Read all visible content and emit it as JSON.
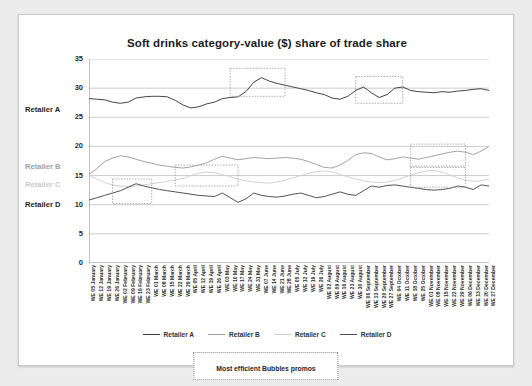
{
  "chart_data": {
    "type": "line",
    "title": "Soft drinks category-value ($) share of trade share",
    "xlabel": "",
    "ylabel": "",
    "ylim": [
      0,
      35
    ],
    "yticks": [
      0,
      5,
      10,
      15,
      20,
      25,
      30,
      35
    ],
    "grid": true,
    "legend_position": "bottom",
    "annotation": "Most efficient Bubbles promos",
    "categories": [
      "WE 05 January",
      "WE 12 January",
      "WE 19 January",
      "WE 26 January",
      "WE 02 February",
      "WE 09 February",
      "WE 16 February",
      "WE 23 February",
      "WE 01 March",
      "WE 08 March",
      "WE 15 March",
      "WE 22 March",
      "WE 29 March",
      "WE 05 April",
      "WE 12 April",
      "WE 19 April",
      "WE 26 April",
      "WE 03 May",
      "WE 10 May",
      "WE 17 May",
      "WE 24 May",
      "WE 31 May",
      "WE 07 June",
      "WE 14 June",
      "WE 21 June",
      "WE 28 June",
      "WE 05 July",
      "WE 12 July",
      "WE 19 July",
      "WE 26 July",
      "WE 02 August",
      "WE 09 August",
      "WE 16 August",
      "WE 23 August",
      "WE 30 August",
      "WE 06 September",
      "WE 13 September",
      "WE 20 September",
      "WE 27 September",
      "WE 04 October",
      "WE 11 October",
      "WE 18 October",
      "WE 25 October",
      "WE 01 November",
      "WE 08 November",
      "WE 15 November",
      "WE 22 November",
      "WE 29 November",
      "WE 06 December",
      "WE 13 December",
      "WE 20 December",
      "WE 27 December"
    ],
    "series": [
      {
        "name": "Retailer A",
        "color": "#3a3a3a",
        "values": [
          28.2,
          28.1,
          28.0,
          27.6,
          27.4,
          27.6,
          28.3,
          28.5,
          28.6,
          28.6,
          28.5,
          27.9,
          27.1,
          26.6,
          26.8,
          27.3,
          27.6,
          28.2,
          28.4,
          28.5,
          29.4,
          31.0,
          31.8,
          31.2,
          30.8,
          30.5,
          30.2,
          29.9,
          29.6,
          29.2,
          28.9,
          28.3,
          28.1,
          28.6,
          29.6,
          30.2,
          29.2,
          28.4,
          28.9,
          30.0,
          30.2,
          29.6,
          29.4,
          29.3,
          29.2,
          29.4,
          29.3,
          29.5,
          29.6,
          29.8,
          29.9,
          29.6
        ]
      },
      {
        "name": "Retailer B",
        "color": "#9d9d9d",
        "values": [
          15.2,
          16.2,
          17.4,
          18.0,
          18.4,
          18.2,
          17.8,
          17.4,
          17.1,
          16.8,
          16.6,
          16.4,
          16.3,
          16.5,
          16.8,
          17.2,
          17.8,
          18.3,
          18.0,
          17.7,
          17.9,
          18.1,
          18.0,
          17.9,
          18.0,
          18.1,
          18.0,
          17.8,
          17.4,
          16.9,
          16.4,
          16.3,
          16.8,
          17.6,
          18.6,
          18.9,
          18.8,
          18.2,
          17.7,
          17.9,
          18.2,
          18.0,
          17.8,
          18.1,
          18.4,
          18.7,
          19.0,
          19.2,
          19.0,
          18.6,
          19.2,
          20.0
        ]
      },
      {
        "name": "Retailer C",
        "color": "#cfcfcf",
        "values": [
          15.1,
          14.4,
          13.8,
          13.4,
          13.2,
          13.1,
          13.2,
          13.4,
          13.6,
          13.8,
          14.0,
          14.3,
          14.5,
          15.0,
          15.4,
          15.6,
          15.5,
          15.2,
          14.8,
          14.4,
          14.1,
          13.9,
          13.8,
          13.7,
          13.9,
          14.2,
          14.6,
          15.0,
          15.4,
          15.7,
          15.8,
          15.6,
          15.2,
          14.8,
          14.4,
          14.1,
          13.9,
          13.8,
          13.9,
          14.2,
          14.6,
          15.1,
          15.5,
          15.8,
          15.9,
          15.6,
          15.1,
          14.6,
          14.2,
          14.0,
          14.1,
          14.4
        ]
      },
      {
        "name": "Retailer D",
        "color": "#4a4a4a",
        "values": [
          10.8,
          11.2,
          11.6,
          12.0,
          12.4,
          13.0,
          13.6,
          13.2,
          12.9,
          12.6,
          12.4,
          12.2,
          12.0,
          11.8,
          11.6,
          11.5,
          11.4,
          12.0,
          11.2,
          10.4,
          11.0,
          12.0,
          11.6,
          11.4,
          11.3,
          11.5,
          11.8,
          12.0,
          11.6,
          11.2,
          11.4,
          11.8,
          12.2,
          11.8,
          11.6,
          12.4,
          13.2,
          13.0,
          13.3,
          13.4,
          13.2,
          13.0,
          12.8,
          12.6,
          12.5,
          12.6,
          12.8,
          13.2,
          13.0,
          12.6,
          13.4,
          13.2
        ]
      }
    ],
    "highlight_boxes": [
      {
        "series": "Retailer A",
        "x_from": 18,
        "x_to": 25,
        "y_from": 28.6,
        "y_to": 33.4
      },
      {
        "series": "Retailer A",
        "x_from": 34,
        "x_to": 40,
        "y_from": 27.4,
        "y_to": 32.0
      },
      {
        "series": "Retailer D",
        "x_from": 3,
        "x_to": 8,
        "y_from": 10.2,
        "y_to": 14.4
      },
      {
        "series": "Retailer C",
        "x_from": 11,
        "x_to": 19,
        "y_from": 13.2,
        "y_to": 16.8
      },
      {
        "series": "Retailer B",
        "x_from": 41,
        "x_to": 48,
        "y_from": 16.6,
        "y_to": 20.4
      },
      {
        "series": "Retailer C",
        "x_from": 41,
        "x_to": 48,
        "y_from": 13.0,
        "y_to": 16.4
      }
    ]
  },
  "side_labels": [
    {
      "label": "Retailer A",
      "color": "#1e1e1e",
      "top": 91
    },
    {
      "label": "Retailer B",
      "color": "#a0a0a0",
      "top": 148
    },
    {
      "label": "Retailer C",
      "color": "#cacaca",
      "top": 166
    },
    {
      "label": "Retailer D",
      "color": "#1e1e1e",
      "top": 186
    }
  ]
}
